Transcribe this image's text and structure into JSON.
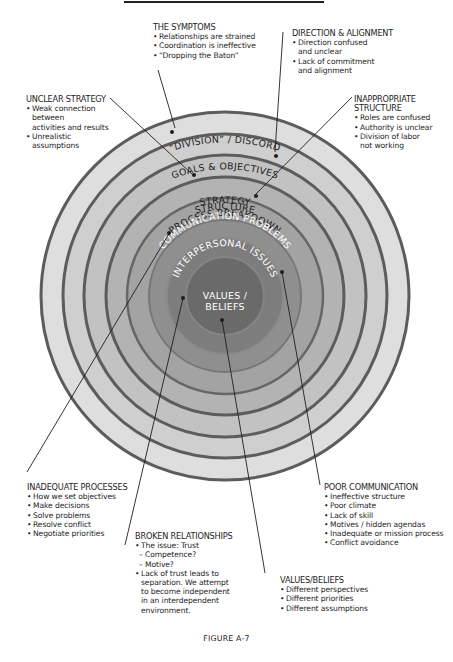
{
  "diagram": {
    "center": {
      "x": 225,
      "y": 296
    },
    "rings": [
      {
        "label": "“DIVISION” / DISCORD",
        "radius": 184,
        "fill": "#dedede",
        "text_color": "#1e1e1e"
      },
      {
        "label": "GOALS & OBJECTIVES",
        "radius": 162,
        "fill": "#cfcfcf",
        "text_color": "#1e1e1e"
      },
      {
        "label": "STRATEGY",
        "radius": 141,
        "fill": "#c2c2c2",
        "text_color": "#1e1e1e"
      },
      {
        "label": "STRUCTURE",
        "radius": 119,
        "fill": "#b3b3b3",
        "text_color": "#1e1e1e"
      },
      {
        "label": "PROCESS BREAKDOWN",
        "radius": 98,
        "fill": "#a3a3a3",
        "text_color": "#1e1e1e"
      },
      {
        "label": "COMMUNICATION PROBLEMS",
        "radius": 76,
        "fill": "#8f8f8f",
        "text_color": "#ffffff"
      },
      {
        "label": "INTERPERSONAL ISSUES",
        "radius": 58,
        "fill": "#7d7d7d",
        "text_color": "#ffffff"
      },
      {
        "label_line1": "VALUES /",
        "label_line2": "BELIEFS",
        "radius": 39,
        "fill": "#6a6a6a",
        "text_color": "#ffffff"
      }
    ],
    "ring_border_color": "#5c5c5c"
  },
  "annotations": {
    "symptoms": {
      "heading": "THE SYMPTOMS",
      "items": [
        "Relationships are strained",
        "Coordination is ineffective",
        "“Dropping the Baton”"
      ]
    },
    "direction": {
      "heading": "DIRECTION & ALIGNMENT",
      "items": [
        [
          "Direction confused",
          "and unclear"
        ],
        [
          "Lack of commitment",
          "and alignment"
        ]
      ]
    },
    "strategy": {
      "heading": "UNCLEAR STRATEGY",
      "items": [
        [
          "Weak connection",
          "between",
          "activities and results"
        ],
        [
          "Unrealistic",
          "assumptions"
        ]
      ]
    },
    "structure": {
      "heading_line1": "INAPPROPRIATE",
      "heading_line2": "STRUCTURE",
      "items": [
        [
          "Roles are confused"
        ],
        [
          "Authority is unclear"
        ],
        [
          "Division of labor",
          "not working"
        ]
      ]
    },
    "processes": {
      "heading": "INADEQUATE PROCESSES",
      "items": [
        "How we set objectives",
        "Make decisions",
        "Solve problems",
        "Resolve conflict",
        "Negotiate priorities"
      ]
    },
    "relationships": {
      "heading": "BROKEN RELATIONSHIPS",
      "item1": "The issue: Trust",
      "sub1": "Competence?",
      "sub2": "Motive?",
      "item2_lines": [
        "Lack of trust leads to",
        "separation. We attempt",
        "to become independent",
        "in an interdependent",
        "environment."
      ]
    },
    "communication": {
      "heading": "POOR COMMUNICATION",
      "items": [
        "Ineffective structure",
        "Poor climate",
        "Lack of skill",
        "Motives / hidden agendas",
        "Inadequate or mission process",
        "Conflict avoidance"
      ]
    },
    "values": {
      "heading": "VALUES/BELIEFS",
      "items": [
        "Different perspectives",
        "Different priorities",
        "Different assumptions"
      ]
    }
  },
  "caption": "FIGURE A-7"
}
